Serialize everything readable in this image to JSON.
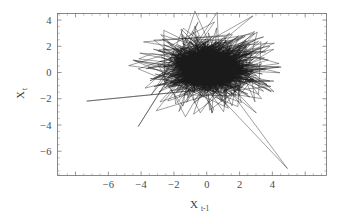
{
  "figure": {
    "name": "lag-plot",
    "background_color": "#ffffff",
    "line_color": "#1a1a1a",
    "axis_color": "#6b6b6b",
    "text_color": "#3f3f3f"
  },
  "chart_data": {
    "type": "line",
    "title": "",
    "subtitle": "",
    "xlabel": "X",
    "xlabel_sub": "t-1",
    "ylabel": "X",
    "ylabel_sub": "t",
    "xlim": [
      -9.1,
      7.3
    ],
    "ylim": [
      -7.85,
      4.5
    ],
    "xticks": [
      -6,
      -4,
      -2,
      0,
      2,
      4
    ],
    "xtick_labels": [
      "-6",
      "-4",
      "-2",
      "0",
      "2",
      "4"
    ],
    "yticks": [
      4,
      2,
      0,
      -2,
      -4,
      -6
    ],
    "ytick_labels": [
      "4",
      "2",
      "0",
      "-2",
      "-4",
      "-6"
    ],
    "minor_tick_step": 0.5,
    "grid": false,
    "legend": null,
    "frame": "box-all-sides",
    "tick_direction": "in",
    "series": [
      {
        "name": "trajectory",
        "style": "connected-polyline",
        "marker": "none",
        "cluster": {
          "center_x": 0.1,
          "center_y": 0.35,
          "radius_x": 2.1,
          "radius_y": 1.55,
          "density": "saturated",
          "point_count": 2400
        },
        "excursions": [
          [
            -7.32,
            -2.18
          ],
          [
            4.92,
            -7.32
          ],
          [
            -0.72,
            4.68
          ],
          [
            2.82,
            4.32
          ],
          [
            -4.18,
            -4.12
          ],
          [
            -4.18,
            0.28
          ],
          [
            3.02,
            -3.08
          ],
          [
            -3.08,
            -2.92
          ],
          [
            4.42,
            0.42
          ],
          [
            -2.62,
            3.22
          ],
          [
            1.62,
            -3.62
          ],
          [
            2.42,
            2.92
          ],
          [
            -1.12,
            -3.38
          ],
          [
            3.52,
            1.12
          ],
          [
            -2.92,
            -0.18
          ]
        ],
        "vertices": [
          [
            0.2,
            0.6
          ],
          [
            1.1,
            -0.3
          ],
          [
            -0.4,
            1.2
          ],
          [
            1.8,
            0.4
          ],
          [
            -1.2,
            -0.6
          ],
          [
            0.6,
            1.6
          ],
          [
            -0.9,
            0.2
          ],
          [
            1.4,
            -1.1
          ],
          [
            0.1,
            0.9
          ],
          [
            -1.6,
            1.4
          ],
          [
            2.2,
            0.1
          ],
          [
            -0.3,
            -1.4
          ],
          [
            1.0,
            1.9
          ],
          [
            -2.0,
            -0.4
          ],
          [
            0.8,
            -0.9
          ],
          [
            -0.6,
            2.1
          ],
          [
            1.7,
            -0.6
          ],
          [
            -1.4,
            -1.7
          ],
          [
            0.4,
            0.2
          ],
          [
            2.6,
            1.2
          ],
          [
            -2.62,
            3.22
          ],
          [
            0.9,
            -2.2
          ],
          [
            -0.72,
            4.68
          ],
          [
            1.3,
            0.7
          ],
          [
            -1.9,
            -2.4
          ],
          [
            2.82,
            4.32
          ],
          [
            -0.2,
            -0.8
          ],
          [
            1.6,
            2.4
          ],
          [
            -3.08,
            -2.92
          ],
          [
            0.5,
            1.1
          ],
          [
            4.42,
            0.42
          ],
          [
            -1.1,
            -0.2
          ],
          [
            0.3,
            -3.1
          ],
          [
            2.1,
            1.5
          ],
          [
            -4.18,
            0.28
          ],
          [
            1.2,
            -1.8
          ],
          [
            -0.5,
            2.8
          ],
          [
            3.02,
            -3.08
          ],
          [
            -1.7,
            0.6
          ],
          [
            0.7,
            -0.4
          ],
          [
            -7.32,
            -2.18
          ],
          [
            2.4,
            2.0
          ],
          [
            -2.3,
            -1.2
          ],
          [
            0.6,
            3.4
          ],
          [
            1.9,
            -2.6
          ],
          [
            -0.8,
            1.0
          ],
          [
            4.92,
            -7.32
          ],
          [
            -4.18,
            -4.12
          ],
          [
            1.5,
            0.3
          ],
          [
            -1.3,
            -3.38
          ],
          [
            0.4,
            2.2
          ],
          [
            3.52,
            1.12
          ],
          [
            -2.92,
            -0.18
          ],
          [
            1.1,
            -1.4
          ],
          [
            -0.6,
            0.5
          ]
        ]
      }
    ]
  },
  "axes": {
    "x_title_main": "X",
    "x_title_sub": "t-1",
    "y_title_main": "X",
    "y_title_sub": "t"
  }
}
